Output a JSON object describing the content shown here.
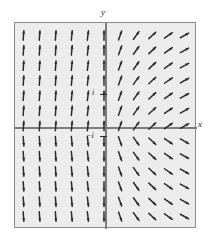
{
  "figure": {
    "kind": "direction-field",
    "background": "#ffffff",
    "plot_background": "#ececec",
    "frame_color": "#8a8a8a",
    "arrow_color": "#2b2b2b"
  },
  "axes": {
    "x_label": "x",
    "y_label": "y",
    "x_axis_name": "horizontal-axis",
    "y_axis_name": "vertical-axis"
  },
  "markers": [
    {
      "label": "i",
      "axis": "y",
      "value": 1
    },
    {
      "label": "−i",
      "axis": "y",
      "value": -1
    }
  ],
  "chart_data": {
    "type": "scatter",
    "title": "",
    "xlabel": "x",
    "ylabel": "y",
    "xlim": [
      -2.6,
      2.6
    ],
    "ylim": [
      -2.9,
      2.9
    ],
    "grid": false,
    "legend": null,
    "annotations": [
      "i",
      "−i"
    ],
    "columns_x": [
      -2.3,
      -1.84,
      -1.38,
      -0.92,
      -0.46,
      0.0,
      0.46,
      0.92,
      1.38,
      1.84,
      2.3
    ],
    "rows_y": [
      2.55,
      2.13,
      1.7,
      1.28,
      0.85,
      0.43,
      0.0,
      -0.43,
      -0.85,
      -1.28,
      -1.7,
      -2.13,
      -2.55
    ],
    "vectors": [
      {
        "x": -2.3,
        "y": 2.55,
        "angle_deg": 72
      },
      {
        "x": -1.84,
        "y": 2.55,
        "angle_deg": 72
      },
      {
        "x": -1.38,
        "y": 2.55,
        "angle_deg": 73
      },
      {
        "x": -0.92,
        "y": 2.55,
        "angle_deg": 74
      },
      {
        "x": -0.46,
        "y": 2.55,
        "angle_deg": 78
      },
      {
        "x": 0.0,
        "y": 2.55,
        "angle_deg": 86
      },
      {
        "x": 0.46,
        "y": 2.55,
        "angle_deg": 62
      },
      {
        "x": 0.92,
        "y": 2.55,
        "angle_deg": 40
      },
      {
        "x": 1.38,
        "y": 2.55,
        "angle_deg": 30
      },
      {
        "x": 1.84,
        "y": 2.55,
        "angle_deg": 25
      },
      {
        "x": 2.3,
        "y": 2.55,
        "angle_deg": 22
      },
      {
        "x": -2.3,
        "y": 0.0,
        "angle_deg": 88
      },
      {
        "x": 2.3,
        "y": 0.0,
        "angle_deg": 2
      },
      {
        "x": -2.3,
        "y": -2.55,
        "angle_deg": -72
      },
      {
        "x": 2.3,
        "y": -2.55,
        "angle_deg": -22
      }
    ]
  }
}
